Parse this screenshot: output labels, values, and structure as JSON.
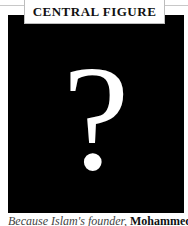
{
  "figure": {
    "label": "CENTRAL FIGURE",
    "placeholder_glyph": "?",
    "background": "#000000",
    "glyph_color": "#ffffff"
  },
  "caption": {
    "italic_text": "Because Islam's founder, ",
    "bold_text": "Mohammed"
  }
}
